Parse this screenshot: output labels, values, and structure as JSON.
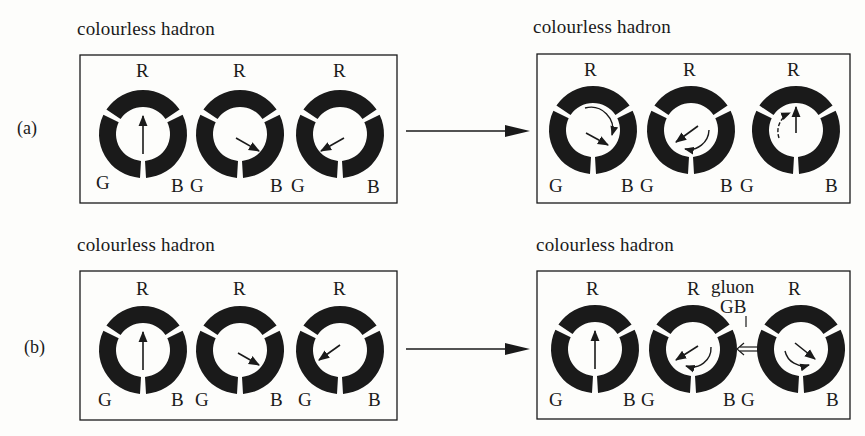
{
  "figure": {
    "rows": [
      {
        "id": "a",
        "label": "(a)",
        "before": {
          "title": "colourless hadron",
          "quarks": [
            {
              "colors": [
                "R",
                "G",
                "B"
              ],
              "arrow": "points to R"
            },
            {
              "colors": [
                "R",
                "G",
                "B"
              ],
              "arrow": "points to B"
            },
            {
              "colors": [
                "R",
                "G",
                "B"
              ],
              "arrow": "points to G"
            }
          ]
        },
        "after": {
          "title": "colourless hadron",
          "quarks": [
            {
              "colors": [
                "R",
                "G",
                "B"
              ],
              "arrow": "points to B",
              "rotation": "R to B"
            },
            {
              "colors": [
                "R",
                "G",
                "B"
              ],
              "arrow": "points to G",
              "rotation": "B to G"
            },
            {
              "colors": [
                "R",
                "G",
                "B"
              ],
              "arrow": "points to R",
              "rotation": "G to R"
            }
          ]
        }
      },
      {
        "id": "b",
        "label": "(b)",
        "before": {
          "title": "colourless hadron",
          "quarks": [
            {
              "colors": [
                "R",
                "G",
                "B"
              ],
              "arrow": "points to R"
            },
            {
              "colors": [
                "R",
                "G",
                "B"
              ],
              "arrow": "points to B"
            },
            {
              "colors": [
                "R",
                "G",
                "B"
              ],
              "arrow": "points to G"
            }
          ]
        },
        "after": {
          "title": "colourless hadron",
          "quarks": [
            {
              "colors": [
                "R",
                "G",
                "B"
              ],
              "arrow": "points to R"
            },
            {
              "colors": [
                "R",
                "G",
                "B"
              ],
              "arrow": "points to G",
              "rotation": "B to G"
            },
            {
              "colors": [
                "R",
                "G",
                "B"
              ],
              "arrow": "points to B",
              "rotation": "G to B"
            }
          ],
          "exchange": {
            "label": "gluon",
            "sublabel": "GB"
          }
        }
      }
    ],
    "color_labels": {
      "red": "R",
      "green": "G",
      "blue": "B"
    },
    "ink_color": "#1a1a1a",
    "paper_color": "#fdfdfb"
  }
}
